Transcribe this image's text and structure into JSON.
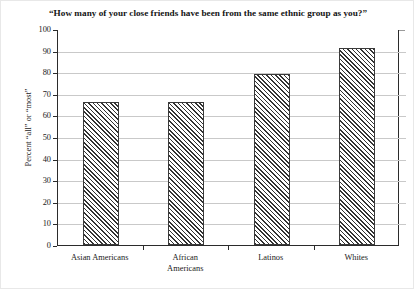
{
  "chart_data": {
    "type": "bar",
    "title": "“How many of your close friends have been from the same ethnic group as you?”",
    "xlabel": "",
    "ylabel": "Percent “all” or “most”",
    "categories": [
      "Asian Americans",
      "African Americans",
      "Latinos",
      "Whites"
    ],
    "category_lines": [
      [
        "Asian Americans"
      ],
      [
        "African",
        "Americans"
      ],
      [
        "Latinos"
      ],
      [
        "Whites"
      ]
    ],
    "values": [
      66,
      66,
      79,
      91
    ],
    "ylim": [
      0,
      100
    ],
    "ytick_labels": [
      "100",
      "90",
      "80",
      "70",
      "60",
      "50",
      "40",
      "30",
      "20",
      "10",
      "0"
    ],
    "ytick_values": [
      100,
      90,
      80,
      70,
      60,
      50,
      40,
      30,
      20,
      10,
      0
    ],
    "grid": true,
    "legend": "none",
    "bar_fill": "diagonal-hatch",
    "colors": {
      "axis": "#2b2b2b",
      "grid": "#c9c9c9",
      "hatch": "#333333",
      "background": "#ffffff",
      "text": "#1a1a1a"
    }
  }
}
